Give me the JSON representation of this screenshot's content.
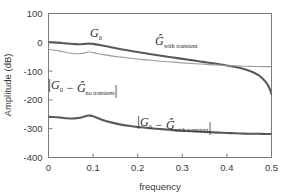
{
  "chart_data": {
    "type": "line",
    "title": "",
    "xlabel": "frequency",
    "ylabel": "Amplitude (dB)",
    "xlim": [
      0,
      0.5
    ],
    "ylim": [
      -400,
      100
    ],
    "xticks": [
      0,
      0.1,
      0.2,
      0.3,
      0.4,
      0.5
    ],
    "xtick_labels": [
      "0",
      "0.1",
      "0.2",
      "0.3",
      "0.4",
      "0.5"
    ],
    "yticks": [
      100,
      0,
      -100,
      -200,
      -300,
      -400
    ],
    "ytick_labels": [
      "100",
      "0",
      "-100",
      "-200",
      "-300",
      "-400"
    ],
    "grid": false,
    "legend_position": "inline-annotations",
    "series": [
      {
        "name": "G_0 and G_hat_with_transient",
        "color": "#595959",
        "width": 2.1,
        "x": [
          0.0,
          0.01,
          0.02,
          0.03,
          0.04,
          0.05,
          0.06,
          0.07,
          0.08,
          0.085,
          0.09,
          0.095,
          0.1,
          0.11,
          0.12,
          0.14,
          0.16,
          0.18,
          0.2,
          0.22,
          0.24,
          0.26,
          0.28,
          0.3,
          0.32,
          0.34,
          0.36,
          0.38,
          0.4,
          0.41,
          0.42,
          0.43,
          0.44,
          0.45,
          0.46,
          0.465,
          0.47,
          0.475,
          0.48,
          0.485,
          0.49,
          0.493,
          0.496,
          0.498,
          0.5
        ],
        "y": [
          0,
          -0.4,
          -1.2,
          -2.4,
          -3.8,
          -5.2,
          -6.2,
          -6.6,
          -6.0,
          -5.2,
          -4.6,
          -4.8,
          -5.6,
          -8.0,
          -11.0,
          -17.0,
          -23.0,
          -28.5,
          -34.0,
          -39.0,
          -44.0,
          -48.5,
          -53.0,
          -57.5,
          -62.0,
          -66.5,
          -71.0,
          -75.5,
          -80.5,
          -83.0,
          -86.0,
          -89.5,
          -93.5,
          -98.5,
          -105.0,
          -109.0,
          -113.5,
          -119.0,
          -126.0,
          -134.0,
          -144.0,
          -152.0,
          -162.0,
          -170.0,
          -180.0
        ]
      },
      {
        "name": "G_hat_no_transient",
        "color": "#9a9a9a",
        "width": 1.1,
        "x": [
          0.0,
          0.01,
          0.02,
          0.03,
          0.04,
          0.05,
          0.06,
          0.07,
          0.08,
          0.085,
          0.09,
          0.095,
          0.1,
          0.11,
          0.12,
          0.14,
          0.16,
          0.18,
          0.2,
          0.22,
          0.24,
          0.26,
          0.28,
          0.3,
          0.32,
          0.34,
          0.36,
          0.38,
          0.4,
          0.42,
          0.44,
          0.45,
          0.46,
          0.47,
          0.48,
          0.49,
          0.5
        ],
        "y": [
          -25.0,
          -26.5,
          -29.0,
          -32.0,
          -35.5,
          -38.0,
          -39.5,
          -39.5,
          -37.5,
          -35.0,
          -33.5,
          -34.0,
          -35.5,
          -39.0,
          -42.0,
          -47.0,
          -51.0,
          -54.5,
          -58.0,
          -61.0,
          -64.0,
          -66.5,
          -69.0,
          -71.5,
          -73.5,
          -75.5,
          -77.5,
          -79.0,
          -80.5,
          -82.0,
          -83.0,
          -83.5,
          -84.0,
          -84.0,
          -84.5,
          -84.5,
          -84.5
        ]
      },
      {
        "name": "abs_G0_minus_Ghat_with_transient",
        "color": "#595959",
        "width": 2.1,
        "x": [
          0.0,
          0.01,
          0.02,
          0.03,
          0.04,
          0.05,
          0.06,
          0.07,
          0.08,
          0.085,
          0.09,
          0.095,
          0.1,
          0.11,
          0.12,
          0.14,
          0.16,
          0.18,
          0.2,
          0.22,
          0.24,
          0.26,
          0.28,
          0.3,
          0.32,
          0.34,
          0.36,
          0.38,
          0.4,
          0.42,
          0.44,
          0.46,
          0.48,
          0.5
        ],
        "y": [
          -259.0,
          -259.5,
          -260.5,
          -262.0,
          -263.5,
          -264.5,
          -264.0,
          -262.0,
          -258.0,
          -255.5,
          -254.0,
          -254.5,
          -257.0,
          -263.0,
          -269.0,
          -278.0,
          -285.0,
          -290.0,
          -294.0,
          -297.0,
          -300.0,
          -302.5,
          -305.0,
          -307.0,
          -309.0,
          -310.5,
          -312.0,
          -313.5,
          -315.0,
          -316.0,
          -317.0,
          -317.5,
          -318.0,
          -318.5
        ]
      }
    ],
    "annotations": [
      {
        "name": "label-g0",
        "base": "G",
        "sub": "0",
        "hat": false,
        "bars": false,
        "x_px": 90,
        "y_px": 37
      },
      {
        "name": "label-ghat-with-transient",
        "base": "G",
        "sub": "with transient",
        "hat": true,
        "bars": false,
        "x_px": 155,
        "y_px": 45
      },
      {
        "name": "label-error-no-transient",
        "base": "G",
        "sub": "0",
        "base2": "G",
        "sub2": "no transient",
        "hat": false,
        "hat2": true,
        "bars": true,
        "minus": "−",
        "x_px": 48,
        "y_px": 89
      },
      {
        "name": "label-error-with-transient",
        "base": "G",
        "sub": "0",
        "base2": "G",
        "sub2": "with transient",
        "hat": false,
        "hat2": true,
        "bars": true,
        "minus": "−",
        "x_px": 137,
        "y_px": 126
      }
    ]
  },
  "axes": {
    "frame_color": "#7d7d7d",
    "background": "#ffffff"
  }
}
